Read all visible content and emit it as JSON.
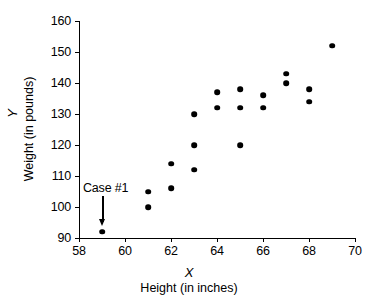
{
  "chart_data": {
    "type": "scatter",
    "title": "",
    "xlabel": "Height (in inches)",
    "ylabel": "Weight (in pounds)",
    "x_variable": "X",
    "y_variable": "Y",
    "xlim": [
      58,
      70
    ],
    "ylim": [
      90,
      160
    ],
    "x_ticks": [
      58,
      60,
      62,
      64,
      66,
      68,
      70
    ],
    "y_ticks": [
      90,
      100,
      110,
      120,
      130,
      140,
      150,
      160
    ],
    "grid": false,
    "legend": null,
    "marker_color": "#000000",
    "points": [
      {
        "x": 59,
        "y": 92
      },
      {
        "x": 61,
        "y": 105
      },
      {
        "x": 61,
        "y": 100
      },
      {
        "x": 62,
        "y": 114
      },
      {
        "x": 62,
        "y": 106
      },
      {
        "x": 63,
        "y": 130
      },
      {
        "x": 63,
        "y": 120
      },
      {
        "x": 63,
        "y": 112
      },
      {
        "x": 64,
        "y": 137
      },
      {
        "x": 64,
        "y": 132
      },
      {
        "x": 65,
        "y": 138
      },
      {
        "x": 65,
        "y": 132
      },
      {
        "x": 65,
        "y": 120
      },
      {
        "x": 66,
        "y": 136
      },
      {
        "x": 66,
        "y": 132
      },
      {
        "x": 67,
        "y": 143
      },
      {
        "x": 67,
        "y": 140
      },
      {
        "x": 68,
        "y": 138
      },
      {
        "x": 68,
        "y": 134
      },
      {
        "x": 69,
        "y": 152
      }
    ],
    "annotations": [
      {
        "label": "Case #1",
        "points_to": {
          "x": 59,
          "y": 92
        }
      }
    ]
  }
}
